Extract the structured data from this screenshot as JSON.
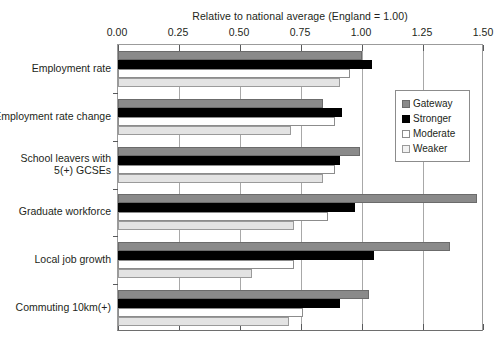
{
  "chart_data": {
    "type": "bar",
    "orientation": "horizontal",
    "title": "Relative to national average (England = 1.00)",
    "xlabel": "",
    "ylabel": "",
    "xlim": [
      0.0,
      1.5
    ],
    "xticks": [
      "0.00",
      "0.25",
      "0.50",
      "0.75",
      "1.00",
      "1.25",
      "1.50"
    ],
    "xtick_values": [
      0.0,
      0.25,
      0.5,
      0.75,
      1.0,
      1.25,
      1.5
    ],
    "grid": true,
    "legend_position": "right",
    "categories": [
      "Employment rate",
      "Employment rate change",
      "School leavers with 5(+) GCSEs",
      "Graduate workforce",
      "Local job growth",
      "Commuting 10km(+)"
    ],
    "category_lines": [
      [
        "Employment rate"
      ],
      [
        "Employment rate change"
      ],
      [
        "School leavers with",
        "5(+) GCSEs"
      ],
      [
        "Graduate workforce"
      ],
      [
        "Local job growth"
      ],
      [
        "Commuting 10km(+)"
      ]
    ],
    "series": [
      {
        "name": "Gateway",
        "color": "#8a8a8a",
        "values": [
          1.0,
          0.84,
          0.99,
          1.47,
          1.36,
          1.03
        ]
      },
      {
        "name": "Stronger",
        "color": "#000000",
        "values": [
          1.04,
          0.92,
          0.91,
          0.97,
          1.05,
          0.91
        ]
      },
      {
        "name": "Moderate",
        "color": "#ffffff",
        "values": [
          0.95,
          0.89,
          0.89,
          0.86,
          0.72,
          0.76
        ]
      },
      {
        "name": "Weaker",
        "color": "#e3e3e3",
        "values": [
          0.91,
          0.71,
          0.84,
          0.72,
          0.55,
          0.7
        ]
      }
    ]
  },
  "legend": {
    "items": [
      {
        "label": "Gateway",
        "key": "gateway"
      },
      {
        "label": "Stronger",
        "key": "stronger"
      },
      {
        "label": "Moderate",
        "key": "moderate"
      },
      {
        "label": "Weaker",
        "key": "weaker"
      }
    ]
  }
}
